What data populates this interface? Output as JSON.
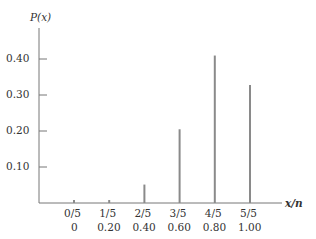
{
  "chart_data": {
    "type": "bar",
    "title": "",
    "xlabel": "x/n",
    "ylabel": "P(x)",
    "categories": [
      "0/5",
      "1/5",
      "2/5",
      "3/5",
      "4/5",
      "5/5"
    ],
    "categories_decimal": [
      "0",
      "0.20",
      "0.40",
      "0.60",
      "0.80",
      "1.00"
    ],
    "values": [
      0.0003,
      0.0064,
      0.0512,
      0.2048,
      0.4096,
      0.3277
    ],
    "yticks": [
      "0.10",
      "0.20",
      "0.30",
      "0.40"
    ],
    "ylim": [
      0,
      0.45
    ],
    "grid": false,
    "legend": null,
    "bar_color": "#8a8a8a",
    "axis_color": "#777777"
  }
}
